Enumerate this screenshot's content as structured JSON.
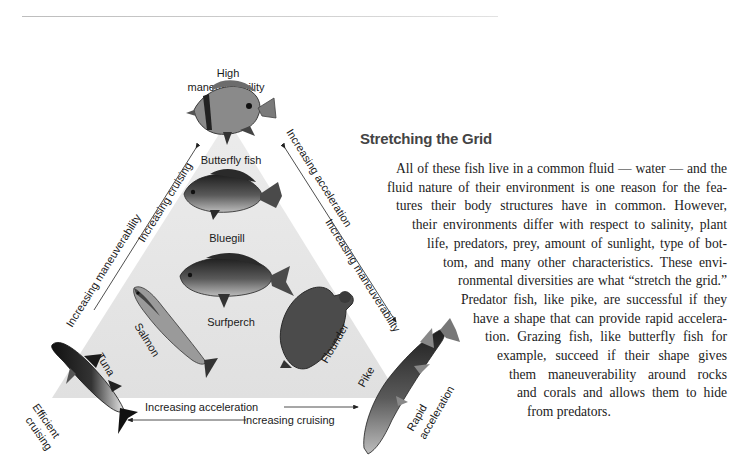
{
  "header_rule": true,
  "diagram": {
    "vertices": {
      "top": {
        "line1": "High",
        "line2": "maneuverability"
      },
      "bottom_left": {
        "line1": "Efficient",
        "line2": "cruising"
      },
      "bottom_right": {
        "line1": "Rapid",
        "line2": "acceleration"
      }
    },
    "edges": {
      "left_outer": "Increasing maneuverability",
      "left_inner": "Increasing cruising",
      "right_outer": "Increasing acceleration",
      "right_inner": "Increasing maneuverability",
      "bottom_upper": "Increasing acceleration",
      "bottom_lower": "Increasing cruising"
    },
    "fish": [
      {
        "name": "Butterfly fish"
      },
      {
        "name": "Bluegill"
      },
      {
        "name": "Surfperch"
      },
      {
        "name": "Salmon"
      },
      {
        "name": "Flounder"
      },
      {
        "name": "Tuna"
      },
      {
        "name": "Pike"
      }
    ],
    "colors": {
      "triangle_fill": "#e4e4e4",
      "fish_dark": "#2a2a2a"
    }
  },
  "article": {
    "heading": "Stretching the Grid",
    "lines": [
      "All of these fish live in a common fluid — water — and the",
      "fluid nature of their environment is one reason for the fea-",
      "tures their body structures have in common.  However,",
      "their environments differ with respect to salinity, plant",
      "life, predators, prey, amount of sunlight, type of bot-",
      "tom, and many other characteristics.  These envi-",
      "ronmental diversities are what “stretch the grid.”",
      "Predator fish, like pike, are successful if they",
      "have a shape that can provide rapid accelera-",
      "tion.  Grazing fish, like butterfly fish for",
      "example, succeed if their shape gives",
      "them maneuverability around rocks",
      "and corals and allows them to hide",
      "from predators."
    ]
  }
}
